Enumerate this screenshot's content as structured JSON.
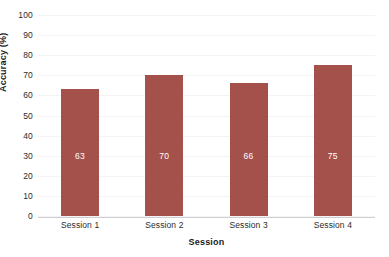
{
  "chart_data": {
    "type": "bar",
    "title": "",
    "categories": [
      "Session 1",
      "Session 2",
      "Session 3",
      "Session 4"
    ],
    "values": [
      63,
      70,
      66,
      75
    ],
    "xlabel": "Session",
    "ylabel": "Accuracy (%)",
    "ylim": [
      0,
      100
    ],
    "yticks": [
      0,
      10,
      20,
      30,
      40,
      50,
      60,
      70,
      80,
      90,
      100
    ],
    "ytick_labels": [
      "0",
      "10",
      "20",
      "30",
      "40",
      "50",
      "60",
      "70",
      "80",
      "90",
      "100"
    ],
    "grid": true,
    "legend": null,
    "bar_color": "#a4504b",
    "value_label_color": "#ffffff",
    "background_color": "#ffffff",
    "gridline_color": "#f4f4f6",
    "axis_line_color": "#cfcfd2",
    "data_labels": [
      "63",
      "70",
      "66",
      "75"
    ]
  }
}
